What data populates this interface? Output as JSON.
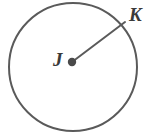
{
  "figure": {
    "kind": "circle-with-radius-diagram",
    "background_color": "#ffffff",
    "stroke_color": "#5a5a5a",
    "label_color": "#3a3a3a",
    "width": 161,
    "height": 140
  },
  "circle": {
    "name": "circle-outline",
    "center_x": 73,
    "center_y": 67,
    "radius": 64,
    "stroke_width": 2,
    "fill": "none"
  },
  "center_point": {
    "name": "center-point-j",
    "x": 72,
    "y": 62,
    "dot_radius": 4.2
  },
  "radius_segment": {
    "name": "radius-segment-jk",
    "from_x": 72,
    "from_y": 62,
    "to_x": 125,
    "to_y": 22,
    "stroke_width": 2
  },
  "labels": {
    "center": "J",
    "edge": "K"
  }
}
